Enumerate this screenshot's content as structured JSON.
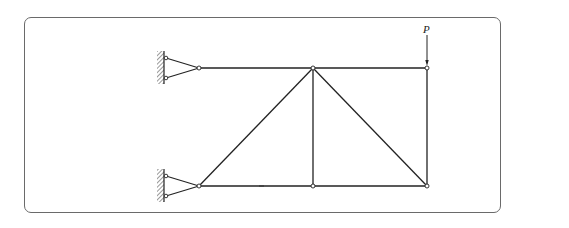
{
  "figure": {
    "type": "truss",
    "load": {
      "label": "P",
      "direction": "down",
      "at_node": "top-right"
    },
    "nodes": {
      "top-left": [
        199,
        68
      ],
      "top-middle": [
        313,
        68
      ],
      "top-right": [
        427,
        68
      ],
      "bottom-left": [
        199,
        186
      ],
      "bottom-middle": [
        313,
        186
      ],
      "bottom-right": [
        427,
        186
      ]
    },
    "members": [
      [
        "top-left",
        "top-middle"
      ],
      [
        "top-middle",
        "top-right"
      ],
      [
        "bottom-left",
        "bottom-middle"
      ],
      [
        "bottom-middle",
        "bottom-right"
      ],
      [
        "bottom-left",
        "top-middle"
      ],
      [
        "top-middle",
        "bottom-middle"
      ],
      [
        "top-middle",
        "bottom-right"
      ],
      [
        "top-right",
        "bottom-right"
      ]
    ],
    "supports": [
      {
        "node": "top-left",
        "type": "pin-wall-left"
      },
      {
        "node": "bottom-left",
        "type": "pin-wall-left"
      }
    ],
    "colors": {
      "line": "#222222",
      "frame": "#6a6a6a",
      "background": "#ffffff"
    }
  }
}
